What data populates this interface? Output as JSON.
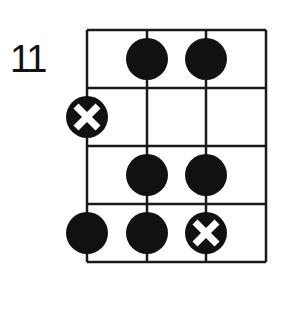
{
  "diagram": {
    "type": "fretboard-chord-chart",
    "start_fret_label": "11",
    "strings": 4,
    "frets": 4,
    "colors": {
      "line": "#1a1a1a",
      "dot": "#111111",
      "x_mark": "#ffffff",
      "background": "#ffffff"
    },
    "markers": [
      {
        "fret": 1,
        "string": 2,
        "type": "dot"
      },
      {
        "fret": 1,
        "string": 3,
        "type": "dot"
      },
      {
        "fret": 2,
        "string": 1,
        "type": "x"
      },
      {
        "fret": 3,
        "string": 2,
        "type": "dot"
      },
      {
        "fret": 3,
        "string": 3,
        "type": "dot"
      },
      {
        "fret": 4,
        "string": 1,
        "type": "dot"
      },
      {
        "fret": 4,
        "string": 2,
        "type": "dot"
      },
      {
        "fret": 4,
        "string": 3,
        "type": "x"
      }
    ]
  }
}
